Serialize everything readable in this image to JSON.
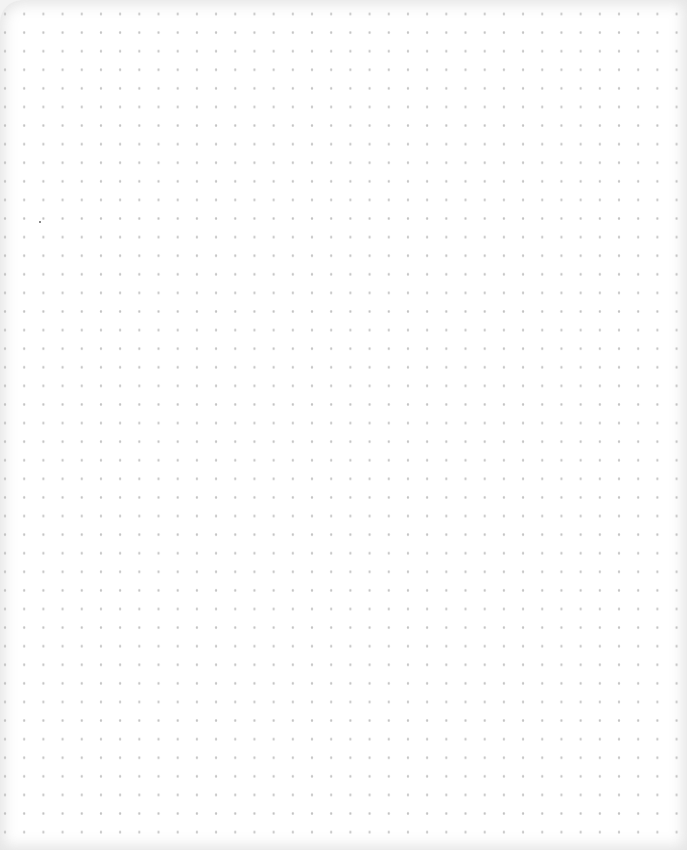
{
  "page": {
    "type": "dot-grid paper",
    "background_color": "#ffffff",
    "dot_color": "#c2c2c2",
    "dot_spacing_x": 19.2,
    "dot_spacing_y": 18.6
  }
}
